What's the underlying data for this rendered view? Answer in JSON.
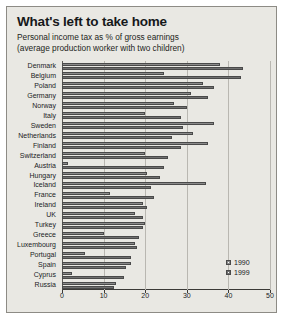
{
  "chart_data": {
    "type": "bar",
    "orientation": "horizontal",
    "title": "What's left to take home",
    "subtitle": "Personal income tax as % of gross earnings (average production worker with two children)",
    "subtitle_lines": [
      "Personal income tax as % of gross earnings",
      "(average production worker with two children)"
    ],
    "xlabel": "",
    "ylabel": "",
    "xlim": [
      0,
      50
    ],
    "xticks": [
      0,
      10,
      20,
      30,
      40,
      50
    ],
    "grid": true,
    "legend_position": "bottom-right",
    "categories": [
      "Denmark",
      "Belgium",
      "Poland",
      "Germany",
      "Norway",
      "Italy",
      "Sweden",
      "Netherlands",
      "Finland",
      "Switzerland",
      "Austria",
      "Hungary",
      "Iceland",
      "France",
      "Ireland",
      "UK",
      "Turkey",
      "Greece",
      "Luxembourg",
      "Portugal",
      "Spain",
      "Cyprus",
      "Russia"
    ],
    "series": [
      {
        "name": "1990",
        "color": "#8a8a8a",
        "values": [
          38.0,
          24.5,
          34.0,
          31.0,
          27.0,
          20.0,
          36.5,
          31.5,
          35.0,
          20.0,
          1.5,
          20.5,
          34.5,
          11.5,
          19.5,
          17.5,
          20.0,
          10.0,
          17.5,
          5.5,
          16.5,
          2.5,
          13.0
        ]
      },
      {
        "name": "1999",
        "color": "#6f6f6f",
        "values": [
          43.5,
          43.0,
          36.5,
          35.0,
          30.0,
          28.5,
          29.0,
          26.5,
          28.5,
          25.5,
          24.5,
          23.5,
          21.5,
          22.0,
          20.5,
          19.5,
          19.5,
          18.5,
          18.0,
          16.5,
          15.5,
          15.0,
          12.5
        ]
      }
    ]
  },
  "legend": {
    "entries": [
      {
        "label": "1990"
      },
      {
        "label": "1999"
      }
    ]
  }
}
